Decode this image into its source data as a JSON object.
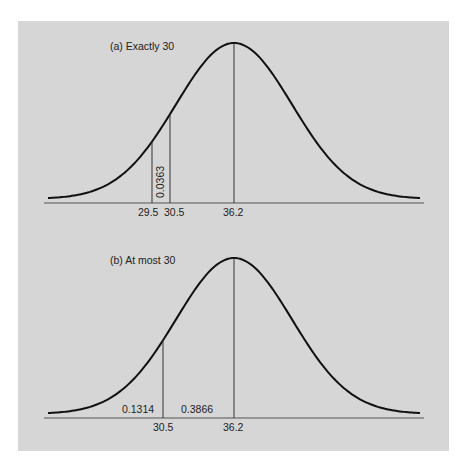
{
  "figure": {
    "background_color": "#d6d6d6",
    "curve_color": "#111111",
    "line_color": "#333333"
  },
  "chart_data": [
    {
      "type": "area",
      "title": "(a)  Exactly 30",
      "distribution": "normal",
      "mean": 36.2,
      "x_ticks": [
        "29.5",
        "30.5",
        "36.2"
      ],
      "x_tick_values": [
        29.5,
        30.5,
        36.2
      ],
      "shaded_region": {
        "from": 29.5,
        "to": 30.5,
        "area_label": "0.0363",
        "label_orientation": "vertical"
      },
      "xlabel": "",
      "ylabel": "",
      "grid": false
    },
    {
      "type": "area",
      "title": "(b)  At most 30",
      "distribution": "normal",
      "mean": 36.2,
      "x_ticks": [
        "30.5",
        "36.2"
      ],
      "x_tick_values": [
        30.5,
        36.2
      ],
      "region_labels": [
        {
          "region": "x < 30.5",
          "area_label": "0.1314"
        },
        {
          "region": "30.5 < x < 36.2",
          "area_label": "0.3866"
        }
      ],
      "xlabel": "",
      "ylabel": "",
      "grid": false
    }
  ],
  "panel_a": {
    "title": "(a)  Exactly 30",
    "tick_1": "29.5",
    "tick_2": "30.5",
    "tick_3": "36.2",
    "area": "0.0363"
  },
  "panel_b": {
    "title": "(b)  At most 30",
    "tick_1": "30.5",
    "tick_2": "36.2",
    "area_left": "0.1314",
    "area_mid": "0.3866"
  }
}
